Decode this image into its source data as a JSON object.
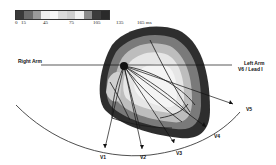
{
  "legend": {
    "unit": "ms",
    "swatches": [
      "#3a3a3a",
      "#6a6a6a",
      "#9a9a9a",
      "#ececec",
      "#f7f7f7",
      "#dcdcdc",
      "#cfcfcf",
      "#f2f2f2",
      "#8c8c8c",
      "#3c3c3c",
      "#2a2a2a"
    ],
    "ticks": [
      {
        "label": "0",
        "x": 3
      },
      {
        "label": "15",
        "x": 9
      },
      {
        "label": "45",
        "x": 31
      },
      {
        "label": "75",
        "x": 57
      },
      {
        "label": "105",
        "x": 81
      },
      {
        "label": "135",
        "x": 104
      },
      {
        "label": "165 ms",
        "x": 125
      }
    ]
  },
  "labels": {
    "right_arm": "Right Arm",
    "left_arm_line1": "Left Arm",
    "left_arm_line2": "V6 / Lead I"
  },
  "leads": [
    {
      "label": "V1",
      "x": 103,
      "y": 157
    },
    {
      "label": "V2",
      "x": 143,
      "y": 157
    },
    {
      "label": "V3",
      "x": 178,
      "y": 150
    },
    {
      "label": "V4",
      "x": 214,
      "y": 135
    },
    {
      "label": "V5",
      "x": 245,
      "y": 108
    }
  ],
  "colors": {
    "outer_dark": "#2e2e2e",
    "mid_gray": "#7a7a7a",
    "light_gray": "#bdbdbd",
    "lightest": "#efefef",
    "line": "#111111"
  }
}
